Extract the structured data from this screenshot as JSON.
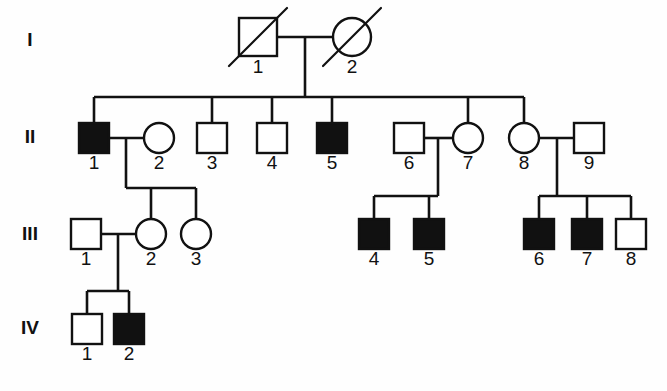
{
  "chart": {
    "type": "pedigree",
    "title": "",
    "width": 667,
    "height": 391,
    "background_color": "#fefefe",
    "line_color": "#111111",
    "affected_fill": "#111111",
    "unaffected_fill": "#ffffff"
  },
  "legend_semantics": {
    "square": "male",
    "circle": "female",
    "filled": "affected",
    "open": "unaffected",
    "slashed": "deceased"
  },
  "generation_labels": [
    {
      "label": "I",
      "x": 30,
      "y": 41
    },
    {
      "label": "II",
      "x": 30,
      "y": 138
    },
    {
      "label": "III",
      "x": 30,
      "y": 235
    },
    {
      "label": "IV",
      "x": 30,
      "y": 329
    }
  ],
  "individuals": [
    {
      "id": "I-1",
      "generation": "I",
      "number": "1",
      "sex": "male",
      "affected": false,
      "deceased": true,
      "cx": 258,
      "cy": 37,
      "size": 38,
      "label_y": 73
    },
    {
      "id": "I-2",
      "generation": "I",
      "number": "2",
      "sex": "female",
      "affected": false,
      "deceased": true,
      "cx": 352,
      "cy": 37,
      "size": 38,
      "label_y": 73
    },
    {
      "id": "II-1",
      "generation": "II",
      "number": "1",
      "sex": "male",
      "affected": true,
      "deceased": false,
      "cx": 94,
      "cy": 138,
      "size": 30,
      "label_y": 169
    },
    {
      "id": "II-2",
      "generation": "II",
      "number": "2",
      "sex": "female",
      "affected": false,
      "deceased": false,
      "cx": 159,
      "cy": 138,
      "size": 30,
      "label_y": 169
    },
    {
      "id": "II-3",
      "generation": "II",
      "number": "3",
      "sex": "male",
      "affected": false,
      "deceased": false,
      "cx": 212,
      "cy": 138,
      "size": 30,
      "label_y": 169
    },
    {
      "id": "II-4",
      "generation": "II",
      "number": "4",
      "sex": "male",
      "affected": false,
      "deceased": false,
      "cx": 272,
      "cy": 138,
      "size": 30,
      "label_y": 169
    },
    {
      "id": "II-5",
      "generation": "II",
      "number": "5",
      "sex": "male",
      "affected": true,
      "deceased": false,
      "cx": 332,
      "cy": 138,
      "size": 30,
      "label_y": 169
    },
    {
      "id": "II-6",
      "generation": "II",
      "number": "6",
      "sex": "male",
      "affected": false,
      "deceased": false,
      "cx": 409,
      "cy": 138,
      "size": 30,
      "label_y": 169
    },
    {
      "id": "II-7",
      "generation": "II",
      "number": "7",
      "sex": "female",
      "affected": false,
      "deceased": false,
      "cx": 468,
      "cy": 138,
      "size": 30,
      "label_y": 169
    },
    {
      "id": "II-8",
      "generation": "II",
      "number": "8",
      "sex": "female",
      "affected": false,
      "deceased": false,
      "cx": 524,
      "cy": 138,
      "size": 30,
      "label_y": 169
    },
    {
      "id": "II-9",
      "generation": "II",
      "number": "9",
      "sex": "male",
      "affected": false,
      "deceased": false,
      "cx": 589,
      "cy": 138,
      "size": 30,
      "label_y": 169
    },
    {
      "id": "III-1",
      "generation": "III",
      "number": "1",
      "sex": "male",
      "affected": false,
      "deceased": false,
      "cx": 86,
      "cy": 234,
      "size": 30,
      "label_y": 265
    },
    {
      "id": "III-2",
      "generation": "III",
      "number": "2",
      "sex": "female",
      "affected": false,
      "deceased": false,
      "cx": 151,
      "cy": 234,
      "size": 30,
      "label_y": 265
    },
    {
      "id": "III-3",
      "generation": "III",
      "number": "3",
      "sex": "female",
      "affected": false,
      "deceased": false,
      "cx": 196,
      "cy": 234,
      "size": 30,
      "label_y": 265
    },
    {
      "id": "III-4",
      "generation": "III",
      "number": "4",
      "sex": "male",
      "affected": true,
      "deceased": false,
      "cx": 374,
      "cy": 234,
      "size": 30,
      "label_y": 265
    },
    {
      "id": "III-5",
      "generation": "III",
      "number": "5",
      "sex": "male",
      "affected": true,
      "deceased": false,
      "cx": 429,
      "cy": 234,
      "size": 30,
      "label_y": 265
    },
    {
      "id": "III-6",
      "generation": "III",
      "number": "6",
      "sex": "male",
      "affected": true,
      "deceased": false,
      "cx": 539,
      "cy": 234,
      "size": 30,
      "label_y": 265
    },
    {
      "id": "III-7",
      "generation": "III",
      "number": "7",
      "sex": "male",
      "affected": true,
      "deceased": false,
      "cx": 587,
      "cy": 234,
      "size": 30,
      "label_y": 265
    },
    {
      "id": "III-8",
      "generation": "III",
      "number": "8",
      "sex": "male",
      "affected": false,
      "deceased": false,
      "cx": 631,
      "cy": 234,
      "size": 30,
      "label_y": 265
    },
    {
      "id": "IV-1",
      "generation": "IV",
      "number": "1",
      "sex": "male",
      "affected": false,
      "deceased": false,
      "cx": 87,
      "cy": 329,
      "size": 30,
      "label_y": 360
    },
    {
      "id": "IV-2",
      "generation": "IV",
      "number": "2",
      "sex": "male",
      "affected": true,
      "deceased": false,
      "cx": 129,
      "cy": 329,
      "size": 30,
      "label_y": 360
    }
  ],
  "connectors": [
    {
      "name": "mating-I1-I2",
      "type": "mating",
      "points": "277,37 333,37"
    },
    {
      "name": "descent-I",
      "type": "descent",
      "points": "305,37 305,97"
    },
    {
      "name": "sibship-II",
      "type": "sibship",
      "points": "94,97 524,97"
    },
    {
      "name": "drop-II1",
      "type": "drop",
      "points": "94,97 94,123"
    },
    {
      "name": "drop-II3",
      "type": "drop",
      "points": "212,97 212,123"
    },
    {
      "name": "drop-II4",
      "type": "drop",
      "points": "272,97 272,123"
    },
    {
      "name": "drop-II5",
      "type": "drop",
      "points": "332,97 332,123"
    },
    {
      "name": "drop-II7",
      "type": "drop",
      "points": "468,97 468,123"
    },
    {
      "name": "drop-II8",
      "type": "drop",
      "points": "524,97 524,123"
    },
    {
      "name": "mating-II1-II2",
      "type": "mating",
      "points": "109,138 144,138"
    },
    {
      "name": "descent-II1",
      "type": "descent",
      "points": "126,138 126,188"
    },
    {
      "name": "sibship-III-A",
      "type": "sibship",
      "points": "126,188 196,188"
    },
    {
      "name": "drop-III2",
      "type": "drop",
      "points": "151,188 151,219"
    },
    {
      "name": "drop-III3",
      "type": "drop",
      "points": "196,188 196,219"
    },
    {
      "name": "mating-II6-II7",
      "type": "mating",
      "points": "424,138 453,138"
    },
    {
      "name": "descent-II6",
      "type": "descent",
      "points": "438,138 438,196"
    },
    {
      "name": "sibship-III-B",
      "type": "sibship",
      "points": "374,196 438,196"
    },
    {
      "name": "drop-III4",
      "type": "drop",
      "points": "374,196 374,219"
    },
    {
      "name": "drop-III5",
      "type": "drop",
      "points": "429,196 429,219"
    },
    {
      "name": "mating-II8-II9",
      "type": "mating",
      "points": "539,138 574,138"
    },
    {
      "name": "descent-II8",
      "type": "descent",
      "points": "557,138 557,196"
    },
    {
      "name": "sibship-III-C",
      "type": "sibship",
      "points": "539,196 631,196"
    },
    {
      "name": "drop-III6",
      "type": "drop",
      "points": "539,196 539,219"
    },
    {
      "name": "drop-III7",
      "type": "drop",
      "points": "587,196 587,219"
    },
    {
      "name": "drop-III8",
      "type": "drop",
      "points": "631,196 631,219"
    },
    {
      "name": "mating-III1-III2",
      "type": "mating",
      "points": "101,234 136,234"
    },
    {
      "name": "descent-III1",
      "type": "descent",
      "points": "118,234 118,291"
    },
    {
      "name": "sibship-IV",
      "type": "sibship",
      "points": "87,291 129,291"
    },
    {
      "name": "drop-IV1",
      "type": "drop",
      "points": "87,291 87,314"
    },
    {
      "name": "drop-IV2",
      "type": "drop",
      "points": "129,291 129,314"
    }
  ],
  "chart_data": {
    "type": "pedigree",
    "title": "",
    "generations": [
      "I",
      "II",
      "III",
      "IV"
    ],
    "counts": {
      "total_individuals": 21,
      "affected": 8,
      "unaffected": 13,
      "deceased": 2,
      "males": 15,
      "females": 6
    },
    "affected_individuals": [
      "II-1",
      "II-5",
      "III-4",
      "III-5",
      "III-6",
      "III-7",
      "IV-2"
    ],
    "matings": [
      {
        "partners": [
          "I-1",
          "I-2"
        ],
        "children": [
          "II-1",
          "II-3",
          "II-4",
          "II-5",
          "II-7",
          "II-8"
        ]
      },
      {
        "partners": [
          "II-1",
          "II-2"
        ],
        "children": [
          "III-2",
          "III-3"
        ]
      },
      {
        "partners": [
          "II-6",
          "II-7"
        ],
        "children": [
          "III-4",
          "III-5"
        ]
      },
      {
        "partners": [
          "II-8",
          "II-9"
        ],
        "children": [
          "III-6",
          "III-7",
          "III-8"
        ]
      },
      {
        "partners": [
          "III-1",
          "III-2"
        ],
        "children": [
          "IV-1",
          "IV-2"
        ]
      }
    ]
  }
}
